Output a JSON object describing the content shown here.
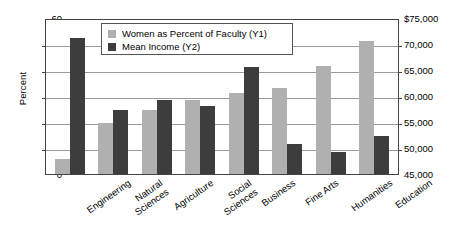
{
  "chart_data": {
    "type": "bar",
    "title": "",
    "categories": [
      "Engineering",
      "Natural Sciences",
      "Agriculture",
      "Social Sciences",
      "Business",
      "Fine Arts",
      "Humanities",
      "Education"
    ],
    "category_lines": [
      [
        "Engineering"
      ],
      [
        "Natural",
        "Sciences"
      ],
      [
        "Agriculture"
      ],
      [
        "Social",
        "Sciences"
      ],
      [
        "Business"
      ],
      [
        "Fine Arts"
      ],
      [
        "Humanities"
      ],
      [
        "Education"
      ]
    ],
    "series": [
      {
        "name": "Women as Percent of Faculty (Y1)",
        "axis": "y1",
        "color": "#b0b0b0",
        "values": [
          6,
          20,
          25,
          29,
          31.5,
          33.5,
          42,
          52
        ]
      },
      {
        "name": "Mean Income (Y2)",
        "axis": "y2",
        "color": "#3d3d3d",
        "values_percent_scale": [
          53,
          25,
          29,
          26.5,
          41.5,
          11.5,
          8.5,
          15
        ],
        "values": [
          71600,
          57500,
          59600,
          58200,
          65800,
          50800,
          49300,
          52500
        ]
      }
    ],
    "xlabel": "",
    "ylabel": "Percent",
    "y1label": "Percent",
    "y2label": "",
    "ylim": [
      0,
      60
    ],
    "y1ticks": [
      "60",
      "50",
      "40",
      "30",
      "20",
      "10",
      "0"
    ],
    "y2lim": [
      45000,
      75000
    ],
    "y2ticks": [
      "$75,000",
      "70,000",
      "65,000",
      "60,000",
      "55,000",
      "50,000",
      "45,000"
    ],
    "grid": true,
    "legend_position": "top-center",
    "legend": [
      "Women as Percent of Faculty (Y1)",
      "Mean Income (Y2)"
    ]
  },
  "colors": {
    "series_light": "#b0b0b0",
    "series_dark": "#3d3d3d",
    "axis": "#444444",
    "grid": "#9a9a9a",
    "background": "#ffffff"
  }
}
